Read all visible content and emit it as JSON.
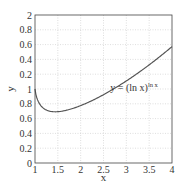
{
  "chart_data": {
    "type": "line",
    "title": "",
    "xlabel": "x",
    "ylabel": "y",
    "xlim": [
      1,
      4
    ],
    "ylim": [
      0,
      2
    ],
    "grid": true,
    "x_ticks": [
      1,
      1.5,
      2,
      2.5,
      3,
      3.5,
      4
    ],
    "x_tick_labels": [
      "1",
      "1.5",
      "2",
      "2.5",
      "3",
      "3.5",
      "4"
    ],
    "y_ticks": [
      0,
      0.2,
      0.4,
      0.6,
      0.8,
      1,
      1.2,
      1.4,
      1.6,
      1.8,
      2
    ],
    "y_tick_labels": [
      "0",
      "0.2",
      "0.4",
      "0.6",
      "0.8",
      "1",
      "0.2",
      "0.4",
      "0.6",
      "0.8",
      "2"
    ],
    "annotation": {
      "text_main": "y = (ln x)",
      "text_sup": "ln x",
      "x": 2.65,
      "y": 0.97
    },
    "series": [
      {
        "name": "y = (ln x)^(ln x)",
        "x": [
          1.0,
          1.02,
          1.05,
          1.1,
          1.2,
          1.3,
          1.444,
          1.6,
          1.8,
          2.0,
          2.25,
          2.5,
          2.75,
          3.0,
          3.25,
          3.5,
          3.75,
          4.0
        ],
        "values": [
          1.0,
          0.924,
          0.862,
          0.798,
          0.735,
          0.701,
          0.692,
          0.701,
          0.73,
          0.775,
          0.842,
          0.92,
          1.007,
          1.101,
          1.201,
          1.306,
          1.417,
          1.573
        ],
        "color": "#555555"
      }
    ]
  },
  "legend": {
    "equation": "y = (ln x)",
    "exponent": "ln x"
  }
}
